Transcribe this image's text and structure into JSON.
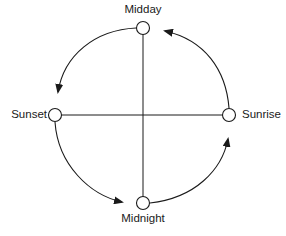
{
  "diagram": {
    "type": "cycle",
    "direction": "counter-clockwise",
    "nodes": {
      "top": {
        "label": "Midday"
      },
      "left": {
        "label": "Sunset"
      },
      "right": {
        "label": "Sunrise"
      },
      "bottom": {
        "label": "Midnight"
      }
    },
    "edges": [
      {
        "from": "Sunrise",
        "to": "Midday"
      },
      {
        "from": "Midday",
        "to": "Sunset"
      },
      {
        "from": "Sunset",
        "to": "Midnight"
      },
      {
        "from": "Midnight",
        "to": "Sunrise"
      }
    ],
    "axes": [
      {
        "from": "Midday",
        "to": "Midnight"
      },
      {
        "from": "Sunset",
        "to": "Sunrise"
      }
    ],
    "colors": {
      "stroke": "#1a1a1a",
      "background": "#ffffff"
    }
  }
}
